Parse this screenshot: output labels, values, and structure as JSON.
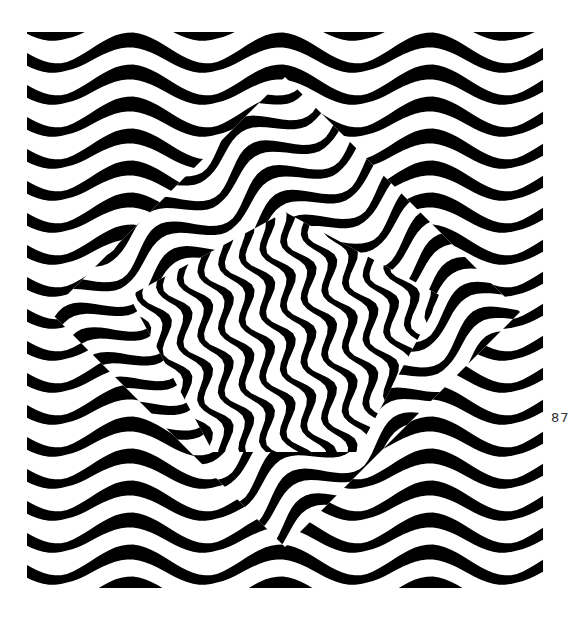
{
  "page": {
    "page_number": "87"
  },
  "artwork": {
    "description": "Op-art black and white wavy stripe pattern with a rotated diamond region of denser distorted waves in the center",
    "colors": {
      "ink": "#000000",
      "paper": "#ffffff"
    },
    "background_pattern": {
      "stripe_spacing": 32,
      "amplitude": 10,
      "wavelength": 150
    },
    "inner_region": {
      "shape": "rotated-square",
      "center": [
        258,
        280
      ],
      "half_diagonal": 235
    },
    "core_region": {
      "shape": "diamond",
      "center": [
        258,
        300
      ],
      "half_diagonal": 120
    }
  }
}
